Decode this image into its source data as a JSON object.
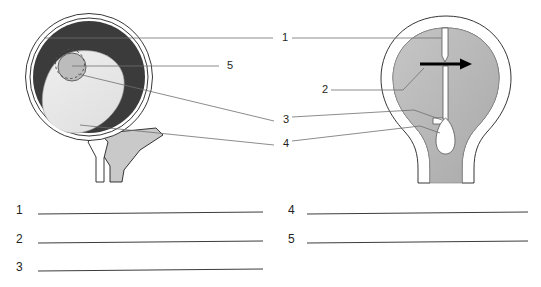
{
  "page": {
    "background": "#ffffff",
    "ink": "#231f20"
  },
  "figure": {
    "colors": {
      "outline": "#231f20",
      "dark_ring": "#3a3a3a",
      "light_mass": "#e8e8e8",
      "medium_circle": "#b9b9b9",
      "body_gray": "#b8b8b8",
      "stalk_gray": "#c8c8c8",
      "arrow": "#000000",
      "leader_line": "#6f6f6f",
      "white": "#ffffff"
    },
    "left_diagram": {
      "name": "ovary-cross-section",
      "parts": [
        {
          "name": "outer-capsule",
          "fill": "#ffffff"
        },
        {
          "name": "dark-cortex-ring",
          "fill": "#3a3a3a"
        },
        {
          "name": "light-inner-mass",
          "fill": "#e8e8e8"
        },
        {
          "name": "small-gray-follicle-circle",
          "fill": "#b9b9b9"
        },
        {
          "name": "dashed-follicle-outline",
          "fill": "none"
        },
        {
          "name": "gray-stalk-ligament",
          "fill": "#c8c8c8"
        }
      ]
    },
    "right_diagram": {
      "name": "uterus-cross-section",
      "parts": [
        {
          "name": "outer-wall",
          "fill": "#ffffff"
        },
        {
          "name": "inner-body-gray",
          "fill": "#b8b8b8"
        },
        {
          "name": "top-slit-channel",
          "fill": "#ffffff"
        },
        {
          "name": "central-canal",
          "fill": "#ffffff"
        },
        {
          "name": "teardrop-bulb",
          "fill": "#ffffff"
        },
        {
          "name": "direction-arrow",
          "fill": "#000000",
          "direction": "right"
        }
      ]
    },
    "leader_labels": [
      {
        "id": "leader-1",
        "text": "1",
        "x": 282,
        "y": 41
      },
      {
        "id": "leader-5",
        "text": "5",
        "x": 227,
        "y": 68
      },
      {
        "id": "leader-2",
        "text": "2",
        "x": 322,
        "y": 92
      },
      {
        "id": "leader-3",
        "text": "3",
        "x": 283,
        "y": 123
      },
      {
        "id": "leader-4",
        "text": "4",
        "x": 283,
        "y": 147
      }
    ]
  },
  "answer_blanks": {
    "left_column": [
      {
        "number": "1",
        "value": "",
        "line_y": 214
      },
      {
        "number": "2",
        "value": "",
        "line_y": 243
      },
      {
        "number": "3",
        "value": "",
        "line_y": 271
      }
    ],
    "right_column": [
      {
        "number": "4",
        "value": "",
        "line_y": 214
      },
      {
        "number": "5",
        "value": "",
        "line_y": 243
      }
    ]
  }
}
